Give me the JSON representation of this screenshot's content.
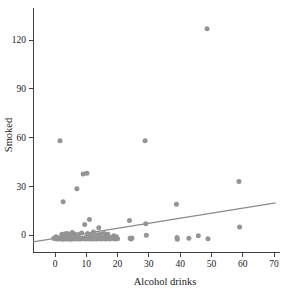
{
  "chart_data": {
    "type": "scatter",
    "title": "",
    "xlabel": "Alcohol drinks",
    "ylabel": "Smoked",
    "xlim": [
      -7,
      72
    ],
    "ylim": [
      -11,
      140
    ],
    "xticks": [
      0,
      10,
      20,
      30,
      40,
      50,
      60,
      70
    ],
    "yticks": [
      0,
      30,
      60,
      90,
      120
    ],
    "xticklabels": [
      "0",
      "10",
      "20",
      "30",
      "40",
      "50",
      "60",
      "70"
    ],
    "yticklabels": [
      "0",
      "30",
      "60",
      "90",
      "120"
    ],
    "grid": false,
    "legend": null,
    "marker_color": "#949494",
    "line_color": "#8a8a8a",
    "axis_color": "#2b2b2b",
    "points": [
      [
        -0.4,
        -2.0
      ],
      [
        0.0,
        -2.2
      ],
      [
        0.3,
        -1.0
      ],
      [
        0.6,
        -2.4
      ],
      [
        1.0,
        -1.8
      ],
      [
        1.2,
        -2.5
      ],
      [
        1.6,
        58.0
      ],
      [
        1.8,
        -1.5
      ],
      [
        2.0,
        -2.3
      ],
      [
        2.2,
        0.5
      ],
      [
        2.4,
        -2.6
      ],
      [
        2.6,
        20.5
      ],
      [
        2.8,
        -1.2
      ],
      [
        3.0,
        -2.4
      ],
      [
        3.2,
        0.8
      ],
      [
        3.5,
        -2.0
      ],
      [
        3.8,
        -2.5
      ],
      [
        4.0,
        1.0
      ],
      [
        4.2,
        -1.6
      ],
      [
        4.5,
        -2.4
      ],
      [
        4.8,
        0.2
      ],
      [
        5.0,
        -2.1
      ],
      [
        5.2,
        -2.6
      ],
      [
        5.5,
        1.5
      ],
      [
        5.8,
        -1.4
      ],
      [
        6.0,
        -2.3
      ],
      [
        6.2,
        0.6
      ],
      [
        6.5,
        -2.5
      ],
      [
        6.8,
        -1.0
      ],
      [
        7.0,
        28.5
      ],
      [
        7.1,
        -2.2
      ],
      [
        7.4,
        0.3
      ],
      [
        7.6,
        -2.4
      ],
      [
        7.9,
        -1.8
      ],
      [
        8.2,
        -2.5
      ],
      [
        8.5,
        1.2
      ],
      [
        8.8,
        -2.0
      ],
      [
        9.0,
        37.5
      ],
      [
        9.2,
        -2.3
      ],
      [
        9.5,
        6.5
      ],
      [
        9.7,
        -1.5
      ],
      [
        9.9,
        -2.4
      ],
      [
        10.2,
        38.0
      ],
      [
        10.4,
        0.9
      ],
      [
        10.6,
        -2.2
      ],
      [
        10.8,
        -1.2
      ],
      [
        11.0,
        9.5
      ],
      [
        11.2,
        -2.5
      ],
      [
        11.5,
        0.4
      ],
      [
        11.8,
        -2.0
      ],
      [
        12.0,
        -2.4
      ],
      [
        12.3,
        1.8
      ],
      [
        12.6,
        -1.6
      ],
      [
        12.9,
        -2.3
      ],
      [
        13.2,
        0.2
      ],
      [
        13.5,
        -2.5
      ],
      [
        13.8,
        -1.1
      ],
      [
        14.0,
        4.5
      ],
      [
        14.2,
        -2.2
      ],
      [
        14.5,
        0.7
      ],
      [
        14.8,
        -2.4
      ],
      [
        15.1,
        -1.8
      ],
      [
        15.4,
        -2.1
      ],
      [
        15.7,
        1.0
      ],
      [
        16.0,
        -2.5
      ],
      [
        16.3,
        -1.3
      ],
      [
        16.6,
        -2.3
      ],
      [
        16.9,
        0.5
      ],
      [
        17.2,
        -2.0
      ],
      [
        17.5,
        -2.5
      ],
      [
        18.0,
        -1.5
      ],
      [
        18.4,
        -2.2
      ],
      [
        18.8,
        -0.5
      ],
      [
        19.2,
        -2.4
      ],
      [
        19.6,
        -1.0
      ],
      [
        20.0,
        -2.3
      ],
      [
        23.8,
        9.0
      ],
      [
        24.0,
        -2.0
      ],
      [
        24.3,
        -2.5
      ],
      [
        24.6,
        -1.8
      ],
      [
        28.8,
        58.0
      ],
      [
        29.0,
        7.0
      ],
      [
        29.2,
        -0.2
      ],
      [
        38.8,
        19.0
      ],
      [
        39.0,
        -1.5
      ],
      [
        39.1,
        -2.6
      ],
      [
        42.8,
        -2.0
      ],
      [
        45.8,
        -0.4
      ],
      [
        48.6,
        127.0
      ],
      [
        48.9,
        -2.3
      ],
      [
        58.8,
        33.0
      ],
      [
        59.0,
        5.0
      ]
    ],
    "fit_line": {
      "x0": -7,
      "y0": -4.2,
      "x1": 70.5,
      "y1": 19.8
    }
  }
}
